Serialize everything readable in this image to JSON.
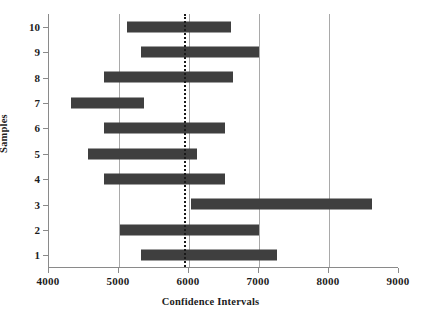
{
  "chart_data": {
    "type": "bar",
    "orientation": "horizontal",
    "title": "",
    "xlabel": "Confidence Intervals",
    "ylabel": "Samples",
    "xlim": [
      4000,
      9000
    ],
    "xticks": [
      4000,
      5000,
      6000,
      7000,
      8000,
      9000
    ],
    "xticklabels": [
      "4000",
      "5000",
      "6000",
      "7000",
      "8000",
      "9000"
    ],
    "categories": [
      "1",
      "2",
      "3",
      "4",
      "5",
      "6",
      "7",
      "8",
      "9",
      "10"
    ],
    "grid": "vertical gridlines at 5000, 6000, 7000, 8000",
    "gridlines": [
      5000,
      6000,
      7000,
      8000
    ],
    "legend": "none",
    "bar_color": "#3f3f3f",
    "reference_line": {
      "value": 5930,
      "style": "dashed",
      "color": "#1a1a1a",
      "label": ""
    },
    "intervals": [
      {
        "sample": "1",
        "low": 5310,
        "high": 7260
      },
      {
        "sample": "2",
        "low": 5010,
        "high": 7000
      },
      {
        "sample": "3",
        "low": 6030,
        "high": 8610
      },
      {
        "sample": "4",
        "low": 4790,
        "high": 6510
      },
      {
        "sample": "5",
        "low": 4560,
        "high": 6110
      },
      {
        "sample": "6",
        "low": 4790,
        "high": 6510
      },
      {
        "sample": "7",
        "low": 4310,
        "high": 5360
      },
      {
        "sample": "8",
        "low": 4790,
        "high": 6630
      },
      {
        "sample": "9",
        "low": 5310,
        "high": 7000
      },
      {
        "sample": "10",
        "low": 5110,
        "high": 6600
      }
    ]
  }
}
